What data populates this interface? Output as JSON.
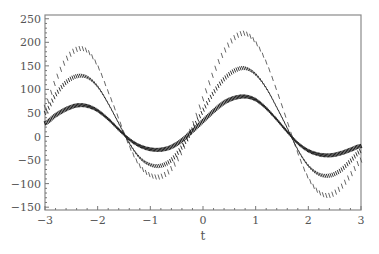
{
  "chart_data": {
    "type": "scatter",
    "title": "",
    "xlabel": "t",
    "ylabel": "",
    "xlim": [
      -3,
      3
    ],
    "ylim": [
      -156,
      258
    ],
    "grid": false,
    "legend": null,
    "x_ticks": [
      -3,
      -2,
      -1,
      0,
      1,
      2,
      3
    ],
    "x_tick_labels": [
      "−3",
      "−2",
      "−1",
      "0",
      "1",
      "2",
      "3"
    ],
    "y_ticks": [
      250,
      200,
      150,
      100,
      50,
      0,
      -50,
      -100,
      -150
    ],
    "y_tick_labels": [
      "250",
      "200",
      "150",
      "100",
      "50",
      "0",
      "−50",
      "−100",
      "−150"
    ],
    "marker": "tick-glyph",
    "series": [
      {
        "name": "outer",
        "x": [
          -3.0,
          -2.8,
          -2.6,
          -2.4,
          -2.2,
          -2.0,
          -1.8,
          -1.6,
          -1.4,
          -1.2,
          -1.0,
          -0.8,
          -0.6,
          -0.4,
          -0.2,
          0.0,
          0.2,
          0.4,
          0.6,
          0.8,
          1.0,
          1.2,
          1.4,
          1.6,
          1.8,
          2.0,
          2.2,
          2.4,
          2.6,
          2.8,
          3.0
        ],
        "values": [
          62,
          118,
          163,
          185,
          182,
          150,
          95,
          38,
          -20,
          -62,
          -82,
          -85,
          -68,
          -30,
          22,
          80,
          135,
          180,
          210,
          219,
          200,
          158,
          98,
          32,
          -35,
          -88,
          -118,
          -125,
          -110,
          -82,
          -50
        ]
      },
      {
        "name": "middle",
        "x": [
          -3.0,
          -2.8,
          -2.6,
          -2.4,
          -2.2,
          -2.0,
          -1.8,
          -1.6,
          -1.4,
          -1.2,
          -1.0,
          -0.8,
          -0.6,
          -0.4,
          -0.2,
          0.0,
          0.2,
          0.4,
          0.6,
          0.8,
          1.0,
          1.2,
          1.4,
          1.6,
          1.8,
          2.0,
          2.2,
          2.4,
          2.6,
          2.8,
          3.0
        ],
        "values": [
          50,
          88,
          115,
          128,
          126,
          106,
          70,
          28,
          -14,
          -45,
          -60,
          -62,
          -50,
          -22,
          15,
          55,
          93,
          122,
          140,
          145,
          132,
          103,
          62,
          18,
          -28,
          -62,
          -80,
          -83,
          -73,
          -52,
          -30
        ]
      },
      {
        "name": "inner",
        "x": [
          -3.0,
          -2.8,
          -2.6,
          -2.4,
          -2.2,
          -2.0,
          -1.8,
          -1.6,
          -1.4,
          -1.2,
          -1.0,
          -0.8,
          -0.6,
          -0.4,
          -0.2,
          0.0,
          0.2,
          0.4,
          0.6,
          0.8,
          1.0,
          1.2,
          1.4,
          1.6,
          1.8,
          2.0,
          2.2,
          2.4,
          2.6,
          2.8,
          3.0
        ],
        "values": [
          28,
          45,
          58,
          66,
          65,
          55,
          37,
          15,
          -6,
          -20,
          -27,
          -28,
          -22,
          -8,
          12,
          33,
          54,
          72,
          82,
          85,
          78,
          60,
          36,
          10,
          -14,
          -30,
          -38,
          -40,
          -36,
          -28,
          -20
        ]
      }
    ]
  }
}
